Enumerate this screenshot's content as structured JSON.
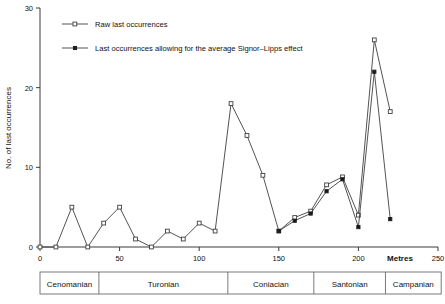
{
  "figure": {
    "background_color": "#ffffff",
    "line_color": "#3f3f3f",
    "axis_color": "#3a3a3a"
  },
  "legend": {
    "position": "top-left-inside",
    "entries": [
      {
        "label": "Raw last occurrences",
        "marker": "open-square",
        "marker_name": "open-square-marker"
      },
      {
        "label": "Last occurrences allowing for the average Signor–Lipps effect",
        "marker": "filled-square",
        "marker_name": "filled-square-marker"
      }
    ]
  },
  "axes": {
    "y": {
      "title": "No. of last occurrences",
      "ticks": [
        "0",
        "10",
        "20",
        "30"
      ],
      "tick_values": [
        0,
        10,
        20,
        30
      ],
      "min": 0,
      "max": 30
    },
    "x": {
      "title": "Metres",
      "ticks": [
        "0",
        "50",
        "100",
        "150",
        "200",
        "250"
      ],
      "tick_values": [
        0,
        50,
        100,
        150,
        200,
        250
      ],
      "min": 0,
      "max": 250
    }
  },
  "stage_bar": {
    "name": "stratigraphic-stage-bar",
    "stages": [
      {
        "label": "Cenomanian",
        "start": 0,
        "end": 37
      },
      {
        "label": "Turonian",
        "start": 37,
        "end": 118
      },
      {
        "label": "Coniacian",
        "start": 118,
        "end": 172
      },
      {
        "label": "Santonian",
        "start": 172,
        "end": 217
      },
      {
        "label": "Campanian",
        "start": 217,
        "end": 252
      }
    ]
  },
  "chart_data": {
    "type": "line",
    "title": "",
    "xlabel": "Metres",
    "ylabel": "No. of last occurrences",
    "xlim": [
      0,
      250
    ],
    "ylim": [
      0,
      30
    ],
    "grid": false,
    "legend_position": "upper left",
    "series": [
      {
        "name": "Raw last occurrences",
        "marker": "open-square",
        "x": [
          0,
          10,
          20,
          30,
          40,
          50,
          60,
          70,
          80,
          90,
          100,
          110,
          120,
          130,
          140,
          150,
          160,
          170,
          180,
          190,
          200,
          210,
          220
        ],
        "values": [
          0,
          0,
          5,
          0,
          3,
          5,
          1,
          0,
          2,
          1,
          3,
          2,
          18,
          14,
          9,
          2,
          3.7,
          4.5,
          7.8,
          8.8,
          4,
          26,
          17
        ]
      },
      {
        "name": "Last occurrences allowing for the average Signor–Lipps effect",
        "marker": "filled-square",
        "x": [
          150,
          160,
          170,
          180,
          190,
          200,
          210,
          220
        ],
        "values": [
          2,
          3.3,
          4.2,
          7,
          8.5,
          2.5,
          22,
          3.5
        ]
      }
    ]
  }
}
